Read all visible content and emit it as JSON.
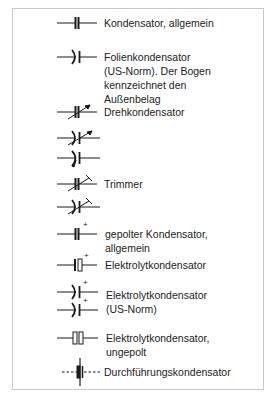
{
  "diagram": {
    "entries": [
      {
        "symbol": "capacitor-general",
        "lines": [
          "Kondensator, allgemein"
        ]
      },
      {
        "symbol": "film-capacitor-us",
        "lines": [
          "Folienkondensator",
          "(US-Norm). Der Bogen",
          "kennzeichnet den",
          "Außenbelag"
        ]
      },
      {
        "symbol": "variable-capacitor",
        "lines": [
          "Drehkondensator"
        ]
      },
      {
        "symbol": "variable-capacitor-us-a",
        "lines": []
      },
      {
        "symbol": "variable-capacitor-us-b",
        "lines": []
      },
      {
        "symbol": "trimmer-capacitor",
        "lines": [
          "Trimmer"
        ]
      },
      {
        "symbol": "trimmer-capacitor-us",
        "lines": []
      },
      {
        "symbol": "polarized-capacitor",
        "lines": [
          "gepolter Kondensator,",
          "allgemein"
        ]
      },
      {
        "symbol": "electrolytic-capacitor",
        "lines": [
          "Elektrolytkondensator"
        ]
      },
      {
        "symbol": "electrolytic-capacitor-us",
        "lines": [
          "Elektrolytkondensator",
          "(US-Norm)"
        ]
      },
      {
        "symbol": "electrolytic-capacitor-unpolarized",
        "lines": [
          "Elektrolytkondensator,",
          "ungepolt"
        ]
      },
      {
        "symbol": "feedthrough-capacitor",
        "lines": [
          "Durchführungskondensator"
        ]
      }
    ],
    "plus_sign": "+",
    "colors": {
      "ink": "#1a1a1a",
      "frame": "#c8c8c8",
      "background": "#ffffff"
    }
  }
}
